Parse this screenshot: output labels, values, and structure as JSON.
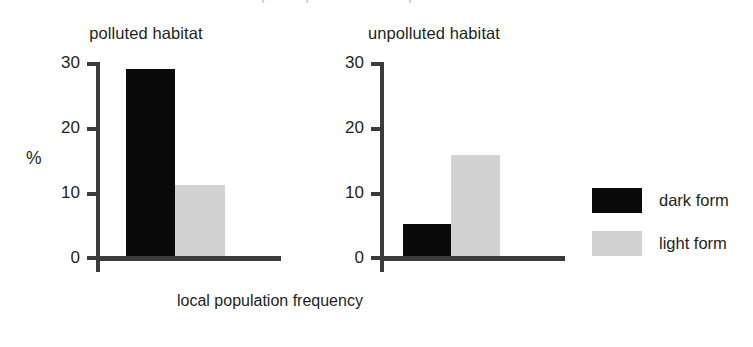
{
  "figure": {
    "clipped_top_text": "morphs in polluted and unpolluted habitats",
    "y_axis_unit": "%",
    "x_axis_caption": "local population frequency"
  },
  "panels": [
    {
      "title": "polluted habitat",
      "ticks": [
        "30",
        "20",
        "10",
        "0"
      ],
      "bars": [
        {
          "series": "dark form",
          "value": 28.7
        },
        {
          "series": "light form",
          "value": 10.9
        }
      ]
    },
    {
      "title": "unpolluted habitat",
      "ticks": [
        "30",
        "20",
        "10",
        "0"
      ],
      "bars": [
        {
          "series": "dark form",
          "value": 4.9
        },
        {
          "series": "light form",
          "value": 15.5
        }
      ]
    }
  ],
  "legend": {
    "items": [
      {
        "label": "dark form",
        "color": "#0a0a0a"
      },
      {
        "label": "light form",
        "color": "#d2d2d2"
      }
    ]
  },
  "chart_data": {
    "type": "bar",
    "title": "",
    "xlabel": "local population frequency",
    "ylabel": "%",
    "ylim": [
      0,
      30
    ],
    "yticks": [
      0,
      10,
      20,
      30
    ],
    "grid": false,
    "legend_position": "right",
    "panels": [
      "polluted habitat",
      "unpolluted habitat"
    ],
    "categories": [
      "polluted habitat",
      "unpolluted habitat"
    ],
    "series": [
      {
        "name": "dark form",
        "color": "#0a0a0a",
        "values": [
          28.7,
          4.9
        ]
      },
      {
        "name": "light form",
        "color": "#d2d2d2",
        "values": [
          10.9,
          15.5
        ]
      }
    ]
  }
}
